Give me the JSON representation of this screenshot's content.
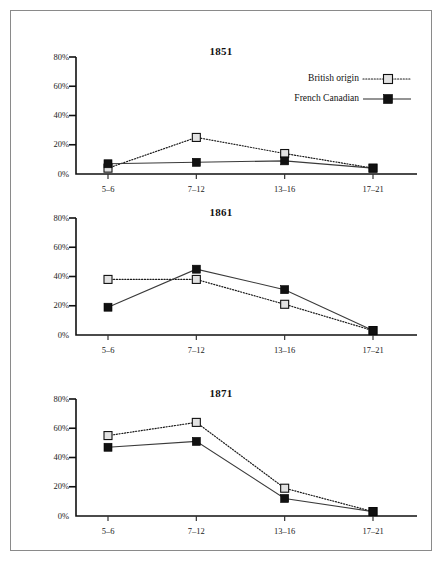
{
  "figure": {
    "background_color": "#ffffff",
    "border_color": "#8a8a8a",
    "ink_color": "#111111",
    "marker_white_fill": "#e2e2e2"
  },
  "legend": {
    "position": "top-right of first panel",
    "entries": [
      {
        "label": "British origin",
        "marker": "open-square-marker",
        "line_style": "dotted"
      },
      {
        "label": "French Canadian",
        "marker": "filled-square-marker",
        "line_style": "solid"
      }
    ]
  },
  "chart_data": [
    {
      "type": "line",
      "title": "1851",
      "categories": [
        "5–6",
        "7–12",
        "13–16",
        "17–21"
      ],
      "series": [
        {
          "name": "British origin",
          "values": [
            4,
            25,
            14,
            4
          ]
        },
        {
          "name": "French Canadian",
          "values": [
            7,
            8,
            9,
            4
          ]
        }
      ],
      "xlabel": "",
      "ylabel": "",
      "ylim": [
        0,
        80
      ],
      "yticks": [
        0,
        20,
        40,
        60,
        80
      ],
      "ytick_labels": [
        "0%",
        "20%",
        "40%",
        "60%",
        "80%"
      ],
      "grid": false,
      "legend_position": "top-right"
    },
    {
      "type": "line",
      "title": "1861",
      "categories": [
        "5–6",
        "7–12",
        "13–16",
        "17–21"
      ],
      "series": [
        {
          "name": "British origin",
          "values": [
            38,
            38,
            21,
            3
          ]
        },
        {
          "name": "French Canadian",
          "values": [
            19,
            45,
            31,
            3
          ]
        }
      ],
      "xlabel": "",
      "ylabel": "",
      "ylim": [
        0,
        80
      ],
      "yticks": [
        0,
        20,
        40,
        60,
        80
      ],
      "ytick_labels": [
        "0%",
        "20%",
        "40%",
        "60%",
        "80%"
      ],
      "grid": false,
      "legend_position": "none"
    },
    {
      "type": "line",
      "title": "1871",
      "categories": [
        "5–6",
        "7–12",
        "13–16",
        "17–21"
      ],
      "series": [
        {
          "name": "British origin",
          "values": [
            55,
            64,
            19,
            3
          ]
        },
        {
          "name": "French Canadian",
          "values": [
            47,
            51,
            12,
            3
          ]
        }
      ],
      "xlabel": "",
      "ylabel": "",
      "ylim": [
        0,
        80
      ],
      "yticks": [
        0,
        20,
        40,
        60,
        80
      ],
      "ytick_labels": [
        "0%",
        "20%",
        "40%",
        "60%",
        "80%"
      ],
      "grid": false,
      "legend_position": "none"
    }
  ]
}
